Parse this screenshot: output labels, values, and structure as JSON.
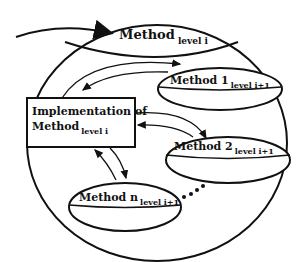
{
  "diagram": {
    "top_method": {
      "main": "Method",
      "sub": "level i"
    },
    "implementation": {
      "line1": "Implementation of",
      "line2_main": "Method",
      "line2_sub": "level i"
    },
    "sub_methods": [
      {
        "main": "Method 1",
        "sub": "level i+1"
      },
      {
        "main": "Method 2",
        "sub": "level i+1"
      },
      {
        "main": "Method n",
        "sub": "level i+1"
      }
    ],
    "continuation": "....",
    "colors": {
      "stroke": "#111111",
      "background": "#ffffff"
    }
  }
}
